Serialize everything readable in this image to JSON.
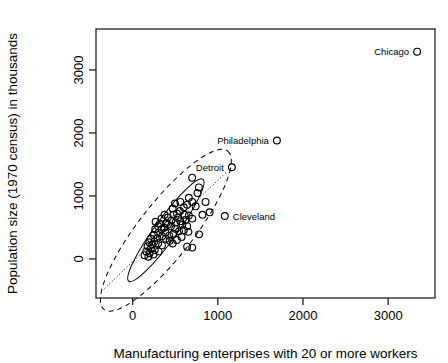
{
  "chart_data": {
    "type": "scatter",
    "title": "",
    "xlabel": "Manufacturing enterprises with 20 or more workers",
    "ylabel": "Population size (1970 census) in thousands",
    "xlim": [
      -430,
      3550
    ],
    "ylim": [
      -620,
      3650
    ],
    "xticks": [
      0,
      1000,
      2000,
      3000
    ],
    "yticks": [
      0,
      1000,
      2000,
      3000
    ],
    "xtick_labels": [
      "0",
      "1000",
      "2000",
      "3000"
    ],
    "ytick_labels": [
      "0",
      "1000",
      "2000",
      "3000"
    ],
    "grid": false,
    "legend": null,
    "marker": "open-circle",
    "annotations": [
      {
        "label": "Chicago",
        "x": 3340,
        "y": 3290,
        "label_side": "left"
      },
      {
        "label": "Philadelphia",
        "x": 1694,
        "y": 1880,
        "label_side": "left"
      },
      {
        "label": "Detroit",
        "x": 1165,
        "y": 1455,
        "label_side": "left"
      },
      {
        "label": "Cleveland",
        "x": 1082,
        "y": 682,
        "label_side": "right"
      }
    ],
    "overlays": [
      {
        "name": "outer-ellipse",
        "style": "dashed",
        "cx": 390,
        "cy": 455,
        "rx": 1180,
        "ry": 430,
        "rotation_deg": -52
      },
      {
        "name": "inner-ellipse",
        "style": "solid",
        "cx": 390,
        "cy": 455,
        "rx": 740,
        "ry": 175,
        "rotation_deg": -54
      },
      {
        "name": "major-axis-line",
        "style": "dotted",
        "x1": -330,
        "y1": -470,
        "x2": 1110,
        "y2": 1390
      }
    ],
    "points": [
      {
        "x": 3340,
        "y": 3290
      },
      {
        "x": 1694,
        "y": 1880
      },
      {
        "x": 1165,
        "y": 1455
      },
      {
        "x": 1082,
        "y": 682
      },
      {
        "x": 699,
        "y": 1290
      },
      {
        "x": 778,
        "y": 1135
      },
      {
        "x": 762,
        "y": 1045
      },
      {
        "x": 856,
        "y": 905
      },
      {
        "x": 905,
        "y": 740
      },
      {
        "x": 699,
        "y": 905
      },
      {
        "x": 640,
        "y": 862
      },
      {
        "x": 600,
        "y": 820
      },
      {
        "x": 560,
        "y": 905
      },
      {
        "x": 497,
        "y": 880
      },
      {
        "x": 470,
        "y": 800
      },
      {
        "x": 555,
        "y": 760
      },
      {
        "x": 520,
        "y": 720
      },
      {
        "x": 610,
        "y": 700
      },
      {
        "x": 660,
        "y": 690
      },
      {
        "x": 700,
        "y": 640
      },
      {
        "x": 620,
        "y": 620
      },
      {
        "x": 560,
        "y": 600
      },
      {
        "x": 505,
        "y": 580
      },
      {
        "x": 455,
        "y": 610
      },
      {
        "x": 415,
        "y": 660
      },
      {
        "x": 375,
        "y": 700
      },
      {
        "x": 340,
        "y": 640
      },
      {
        "x": 395,
        "y": 570
      },
      {
        "x": 450,
        "y": 520
      },
      {
        "x": 500,
        "y": 480
      },
      {
        "x": 545,
        "y": 440
      },
      {
        "x": 600,
        "y": 455
      },
      {
        "x": 655,
        "y": 430
      },
      {
        "x": 480,
        "y": 400
      },
      {
        "x": 430,
        "y": 370
      },
      {
        "x": 385,
        "y": 420
      },
      {
        "x": 340,
        "y": 470
      },
      {
        "x": 300,
        "y": 520
      },
      {
        "x": 265,
        "y": 470
      },
      {
        "x": 300,
        "y": 410
      },
      {
        "x": 345,
        "y": 360
      },
      {
        "x": 390,
        "y": 320
      },
      {
        "x": 435,
        "y": 290
      },
      {
        "x": 290,
        "y": 330
      },
      {
        "x": 250,
        "y": 380
      },
      {
        "x": 215,
        "y": 320
      },
      {
        "x": 255,
        "y": 275
      },
      {
        "x": 300,
        "y": 250
      },
      {
        "x": 345,
        "y": 215
      },
      {
        "x": 230,
        "y": 225
      },
      {
        "x": 195,
        "y": 265
      },
      {
        "x": 175,
        "y": 200
      },
      {
        "x": 215,
        "y": 165
      },
      {
        "x": 260,
        "y": 140
      },
      {
        "x": 305,
        "y": 120
      },
      {
        "x": 160,
        "y": 120
      },
      {
        "x": 200,
        "y": 90
      },
      {
        "x": 245,
        "y": 70
      },
      {
        "x": 140,
        "y": 60
      },
      {
        "x": 185,
        "y": 35
      },
      {
        "x": 640,
        "y": 195
      },
      {
        "x": 700,
        "y": 180
      },
      {
        "x": 780,
        "y": 390
      },
      {
        "x": 470,
        "y": 245
      },
      {
        "x": 520,
        "y": 300
      },
      {
        "x": 575,
        "y": 350
      },
      {
        "x": 370,
        "y": 495
      },
      {
        "x": 415,
        "y": 545
      },
      {
        "x": 640,
        "y": 520
      },
      {
        "x": 585,
        "y": 545
      },
      {
        "x": 740,
        "y": 835
      },
      {
        "x": 820,
        "y": 700
      },
      {
        "x": 660,
        "y": 970
      },
      {
        "x": 480,
        "y": 700
      },
      {
        "x": 530,
        "y": 655
      },
      {
        "x": 270,
        "y": 590
      },
      {
        "x": 320,
        "y": 560
      }
    ]
  }
}
